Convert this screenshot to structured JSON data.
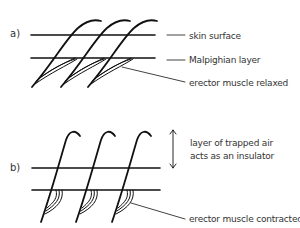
{
  "panel_a": {
    "letter": "a)",
    "labels": {
      "skin_surface": "skin surface",
      "malpighian_layer": "Malpighian layer",
      "erector_muscle": "erector muscle relaxed"
    }
  },
  "panel_b": {
    "letter": "b)",
    "labels": {
      "air_line1": "layer of trapped air",
      "air_line2": "acts as an insulator",
      "erector_muscle": "erector muscle contracted"
    }
  },
  "colors": {
    "stroke": "#111111",
    "text": "#333333",
    "background": "#ffffff"
  }
}
